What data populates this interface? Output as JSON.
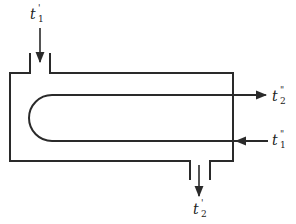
{
  "diagram": {
    "type": "heat-exchanger-schematic",
    "line_color": "#2a2a2a",
    "labels": {
      "shell_inlet": {
        "base": "t",
        "sup": "'",
        "sub": "1"
      },
      "shell_outlet": {
        "base": "t",
        "sup": "'",
        "sub": "2"
      },
      "tube_outlet": {
        "base": "t",
        "sup": "\"",
        "sub": "2"
      },
      "tube_inlet": {
        "base": "t",
        "sup": "\"",
        "sub": "1"
      }
    }
  }
}
